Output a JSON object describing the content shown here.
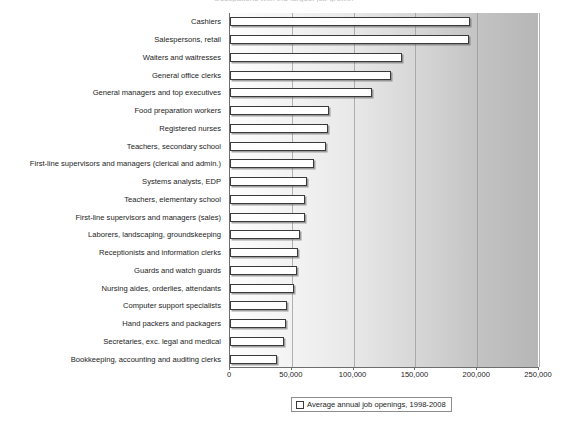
{
  "title": "Occupations with the largest job growth",
  "legend": {
    "label": "Average annual job openings, 1998-2008",
    "marker": "white-square-swatch"
  },
  "axis": {
    "x_ticks": [
      "0",
      "50,000",
      "100,000",
      "150,000",
      "200,000",
      "250,000"
    ],
    "x_tick_values": [
      0,
      50000,
      100000,
      150000,
      200000,
      250000
    ],
    "x_min": 0,
    "x_max": 250000
  },
  "chart_data": {
    "type": "bar",
    "orientation": "horizontal",
    "title": "Occupations with the largest job growth",
    "xlabel": "",
    "ylabel": "",
    "xlim": [
      0,
      250000
    ],
    "grid": true,
    "grid_axis": "x",
    "legend_position": "bottom",
    "series_name": "Average annual job openings, 1998-2008",
    "categories": [
      "Cashiers",
      "Salespersons, retail",
      "Waiters and waitresses",
      "General office clerks",
      "General managers and top executives",
      "Food preparation workers",
      "Registered nurses",
      "Teachers, secondary school",
      "First-line supervisors and managers (clerical and admin.)",
      "Systems analysts, EDP",
      "Teachers, elementary school",
      "First-line supervisors and managers (sales)",
      "Laborers, landscaping, groundskeeping",
      "Receptionists and information clerks",
      "Guards and watch guards",
      "Nursing aides, orderlies, attendants",
      "Computer support specialists",
      "Hand packers and packagers",
      "Secretaries, exc. legal and medical",
      "Bookkeeping, accounting and auditing clerks"
    ],
    "values": [
      194000,
      193000,
      139000,
      130000,
      115000,
      80000,
      79000,
      78000,
      68000,
      62000,
      61000,
      61000,
      57000,
      55000,
      54000,
      52000,
      46000,
      45000,
      44000,
      38000
    ]
  }
}
